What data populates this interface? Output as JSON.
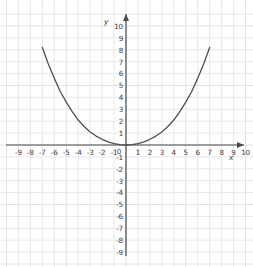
{
  "figure": {
    "title": "",
    "background_color": "#ffffff",
    "grid_color": "#e9e9ec",
    "axis_color": "#4a4a4a",
    "curve_color": "#4f4f4f"
  },
  "chart_data": {
    "type": "line",
    "title": "",
    "subtitle": "",
    "xlabel": "x",
    "ylabel": "y",
    "xlim": [
      -10,
      10.5
    ],
    "ylim": [
      -9.5,
      10.5
    ],
    "grid": true,
    "legend": null,
    "legend_position": "none",
    "x_tick_labels": [
      "-9",
      "-8",
      "-7",
      "-6",
      "-5",
      "-4",
      "-3",
      "-2",
      "-1",
      "0",
      "1",
      "2",
      "3",
      "4",
      "5",
      "6",
      "7",
      "8",
      "9",
      "10"
    ],
    "x_tick_values": [
      -9,
      -8,
      -7,
      -6,
      -5,
      -4,
      -3,
      -2,
      -1,
      0,
      1,
      2,
      3,
      4,
      5,
      6,
      7,
      8,
      9,
      10
    ],
    "y_tick_labels": [
      "10",
      "9",
      "8",
      "7",
      "6",
      "5",
      "4",
      "3",
      "2",
      "1",
      "-1",
      "-2",
      "-3",
      "-4",
      "-5",
      "-6",
      "-7",
      "-8",
      "-9"
    ],
    "y_tick_values": [
      10,
      9,
      8,
      7,
      6,
      5,
      4,
      3,
      2,
      1,
      -1,
      -2,
      -3,
      -4,
      -5,
      -6,
      -7,
      -8,
      -9
    ],
    "origin_label": "0",
    "series": [
      {
        "name": "curve",
        "x": [
          -7.0,
          -6.5,
          -6.0,
          -5.5,
          -5.0,
          -4.5,
          -4.0,
          -3.5,
          -3.0,
          -2.5,
          -2.0,
          -1.5,
          -1.0,
          -0.5,
          0.0,
          0.5,
          1.0,
          1.5,
          2.0,
          2.5,
          3.0,
          3.5,
          4.0,
          4.5,
          5.0,
          5.5,
          6.0,
          6.5,
          7.0
        ],
        "y": [
          8.2,
          6.8,
          5.6,
          4.5,
          3.6,
          2.8,
          2.1,
          1.55,
          1.1,
          0.75,
          0.48,
          0.27,
          0.12,
          0.03,
          0.0,
          0.03,
          0.12,
          0.27,
          0.48,
          0.75,
          1.1,
          1.55,
          2.1,
          2.8,
          3.6,
          4.5,
          5.6,
          6.8,
          8.2
        ]
      }
    ]
  }
}
